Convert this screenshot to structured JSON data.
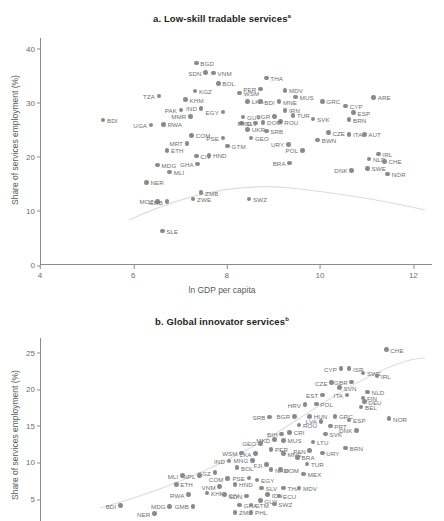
{
  "figure": {
    "axis_color": "#8c8c8c",
    "dot_color": "#8a8a8a",
    "label_color": "#6e6e6e",
    "title_color": "#231f20"
  },
  "panel_a": {
    "title": "a. Low-skill tradable services",
    "title_note": "a",
    "xlabel": "ln GDP per capita",
    "ylabel": "Share of services employment (%)"
  },
  "panel_b": {
    "title": "b. Global innovator services",
    "title_note": "b",
    "xlabel": "ln GDP per capita",
    "ylabel": "Share of services employment (%)"
  },
  "chart_data": [
    {
      "type": "scatter",
      "panel": "a",
      "title": "a. Low-skill tradable services",
      "xlabel": "ln GDP per capita",
      "ylabel": "Share of services employment (%)",
      "xlim": [
        4,
        12.4
      ],
      "ylim": [
        0,
        42
      ],
      "xticks": [
        4,
        6,
        8,
        10,
        12
      ],
      "yticks": [
        0,
        10,
        20,
        30,
        40
      ],
      "grid": false,
      "legend": "none",
      "has_fitted_curve": true,
      "fitted_curve_note": "light gray quadratic/lowess fit, rising from ~19% at x=5.9 to peak ~23.5% near x=8.5 then declining to ~20% at x=11.8",
      "points": [
        {
          "label": "BDI",
          "x": 5.35,
          "y": 26.8,
          "lpos": "r"
        },
        {
          "label": "BGD",
          "x": 7.35,
          "y": 37.4,
          "lpos": "r"
        },
        {
          "label": "SDN",
          "x": 7.55,
          "y": 35.6,
          "lpos": "l"
        },
        {
          "label": "VNM",
          "x": 7.72,
          "y": 35.5,
          "lpos": "r"
        },
        {
          "label": "WSM",
          "x": 8.28,
          "y": 31.8,
          "lpos": "r"
        },
        {
          "label": "THA",
          "x": 8.85,
          "y": 34.6,
          "lpos": "r"
        },
        {
          "label": "BOL",
          "x": 7.82,
          "y": 33.6,
          "lpos": "r"
        },
        {
          "label": "KGZ",
          "x": 7.32,
          "y": 32.2,
          "lpos": "r"
        },
        {
          "label": "TZA",
          "x": 6.55,
          "y": 31.3,
          "lpos": "l"
        },
        {
          "label": "PER",
          "x": 8.72,
          "y": 32.6,
          "lpos": "l"
        },
        {
          "label": "MDV",
          "x": 9.25,
          "y": 32.3,
          "lpos": "r"
        },
        {
          "label": "MUS",
          "x": 9.48,
          "y": 31.1,
          "lpos": "r"
        },
        {
          "label": "KHM",
          "x": 7.12,
          "y": 30.6,
          "lpos": "r"
        },
        {
          "label": "PAK",
          "x": 7.02,
          "y": 28.7,
          "lpos": "l"
        },
        {
          "label": "IND",
          "x": 7.45,
          "y": 29.0,
          "lpos": "l"
        },
        {
          "label": "EGY",
          "x": 7.92,
          "y": 28.3,
          "lpos": "l"
        },
        {
          "label": "LKA",
          "x": 8.45,
          "y": 30.3,
          "lpos": "r"
        },
        {
          "label": "BDI2",
          "x": 8.72,
          "y": 30.2,
          "lpos": "r"
        },
        {
          "label": "MNE",
          "x": 9.12,
          "y": 30.2,
          "lpos": "r"
        },
        {
          "label": "ARE",
          "x": 11.15,
          "y": 31.0,
          "lpos": "r"
        },
        {
          "label": "GRC",
          "x": 10.05,
          "y": 30.3,
          "lpos": "r"
        },
        {
          "label": "CYP",
          "x": 10.55,
          "y": 29.4,
          "lpos": "r"
        },
        {
          "label": "ESP",
          "x": 10.72,
          "y": 28.2,
          "lpos": "r"
        },
        {
          "label": "IRN",
          "x": 9.25,
          "y": 28.6,
          "lpos": "r"
        },
        {
          "label": "MMR",
          "x": 7.22,
          "y": 27.5,
          "lpos": "l"
        },
        {
          "label": "RWA",
          "x": 6.65,
          "y": 26.0,
          "lpos": "r"
        },
        {
          "label": "UGA",
          "x": 6.38,
          "y": 25.9,
          "lpos": "l"
        },
        {
          "label": "GUY",
          "x": 8.35,
          "y": 27.4,
          "lpos": "r"
        },
        {
          "label": "SLV",
          "x": 8.32,
          "y": 26.3,
          "lpos": "r"
        },
        {
          "label": "BGR",
          "x": 9.02,
          "y": 27.5,
          "lpos": "l"
        },
        {
          "label": "TUR",
          "x": 9.42,
          "y": 27.7,
          "lpos": "r"
        },
        {
          "label": "SVK",
          "x": 9.85,
          "y": 27.0,
          "lpos": "r"
        },
        {
          "label": "BRN",
          "x": 10.62,
          "y": 26.9,
          "lpos": "r"
        },
        {
          "label": "ROU",
          "x": 9.15,
          "y": 26.5,
          "lpos": "r"
        },
        {
          "label": "DOM",
          "x": 8.78,
          "y": 26.4,
          "lpos": "r"
        },
        {
          "label": "MKD",
          "x": 8.62,
          "y": 26.3,
          "lpos": "l"
        },
        {
          "label": "COM",
          "x": 7.25,
          "y": 24.0,
          "lpos": "r"
        },
        {
          "label": "UKR",
          "x": 8.45,
          "y": 25.1,
          "lpos": "r"
        },
        {
          "label": "SRB",
          "x": 8.85,
          "y": 24.8,
          "lpos": "r"
        },
        {
          "label": "CZE",
          "x": 10.18,
          "y": 24.5,
          "lpos": "r"
        },
        {
          "label": "ITA",
          "x": 10.62,
          "y": 24.2,
          "lpos": "r"
        },
        {
          "label": "AUT",
          "x": 10.95,
          "y": 24.2,
          "lpos": "r"
        },
        {
          "label": "PSE",
          "x": 7.92,
          "y": 23.5,
          "lpos": "l"
        },
        {
          "label": "GEO",
          "x": 8.52,
          "y": 23.5,
          "lpos": "r"
        },
        {
          "label": "BWN",
          "x": 9.95,
          "y": 23.1,
          "lpos": "r"
        },
        {
          "label": "MRT",
          "x": 7.15,
          "y": 22.5,
          "lpos": "l"
        },
        {
          "label": "GTM",
          "x": 8.02,
          "y": 22.0,
          "lpos": "r"
        },
        {
          "label": "URY",
          "x": 9.32,
          "y": 22.3,
          "lpos": "l"
        },
        {
          "label": "POL",
          "x": 9.62,
          "y": 21.2,
          "lpos": "l"
        },
        {
          "label": "ETH",
          "x": 6.72,
          "y": 21.2,
          "lpos": "r"
        },
        {
          "label": "CIV",
          "x": 7.35,
          "y": 20.2,
          "lpos": "r"
        },
        {
          "label": "HND",
          "x": 7.62,
          "y": 20.3,
          "lpos": "r"
        },
        {
          "label": "IRL",
          "x": 11.25,
          "y": 20.5,
          "lpos": "r"
        },
        {
          "label": "NLD",
          "x": 11.05,
          "y": 19.6,
          "lpos": "r"
        },
        {
          "label": "CHE",
          "x": 11.38,
          "y": 19.2,
          "lpos": "r"
        },
        {
          "label": "GHA",
          "x": 7.38,
          "y": 18.7,
          "lpos": "l"
        },
        {
          "label": "MDG",
          "x": 6.52,
          "y": 18.5,
          "lpos": "r"
        },
        {
          "label": "BRA",
          "x": 9.35,
          "y": 18.9,
          "lpos": "l"
        },
        {
          "label": "SWE",
          "x": 11.02,
          "y": 17.9,
          "lpos": "r"
        },
        {
          "label": "DNK",
          "x": 10.68,
          "y": 17.5,
          "lpos": "l"
        },
        {
          "label": "MLI",
          "x": 6.78,
          "y": 17.2,
          "lpos": "r"
        },
        {
          "label": "NOR",
          "x": 11.45,
          "y": 16.8,
          "lpos": "r"
        },
        {
          "label": "NER",
          "x": 6.28,
          "y": 15.3,
          "lpos": "r"
        },
        {
          "label": "ZMB",
          "x": 7.45,
          "y": 13.4,
          "lpos": "r"
        },
        {
          "label": "ZWE",
          "x": 7.28,
          "y": 12.2,
          "lpos": "r"
        },
        {
          "label": "MOZ",
          "x": 6.52,
          "y": 11.8,
          "lpos": "l"
        },
        {
          "label": "GMB",
          "x": 6.72,
          "y": 11.7,
          "lpos": "l"
        },
        {
          "label": "SWZ",
          "x": 8.48,
          "y": 12.2,
          "lpos": "r"
        },
        {
          "label": "SLE",
          "x": 6.62,
          "y": 6.3,
          "lpos": "r"
        }
      ]
    },
    {
      "type": "scatter",
      "panel": "b",
      "title": "b. Global innovator services",
      "xlabel": "ln GDP per capita",
      "ylabel": "Share of services employment (%)",
      "xlim": [
        4,
        12.4
      ],
      "ylim": [
        2,
        27
      ],
      "xticks": [
        4,
        6,
        8,
        10,
        12
      ],
      "yticks": [
        5,
        10,
        15,
        20,
        25
      ],
      "grid": false,
      "legend": "none",
      "has_fitted_curve": true,
      "fitted_curve_note": "light gray upward-sloping fit from ~3.5% at low GDP to ~19% at high GDP",
      "points": [
        {
          "label": "CHE",
          "x": 11.42,
          "y": 25.4,
          "lpos": "r"
        },
        {
          "label": "CYP",
          "x": 10.45,
          "y": 22.8,
          "lpos": "l"
        },
        {
          "label": "ISR",
          "x": 10.62,
          "y": 22.8,
          "lpos": "r"
        },
        {
          "label": "SWE",
          "x": 10.92,
          "y": 22.2,
          "lpos": "r"
        },
        {
          "label": "IRL",
          "x": 11.22,
          "y": 21.8,
          "lpos": "r"
        },
        {
          "label": "GBR",
          "x": 10.68,
          "y": 21.0,
          "lpos": "l"
        },
        {
          "label": "CZE",
          "x": 10.25,
          "y": 20.9,
          "lpos": "l"
        },
        {
          "label": "SVN",
          "x": 10.42,
          "y": 20.2,
          "lpos": "r"
        },
        {
          "label": "NLD",
          "x": 11.02,
          "y": 19.6,
          "lpos": "r"
        },
        {
          "label": "EST",
          "x": 10.05,
          "y": 19.2,
          "lpos": "l"
        },
        {
          "label": "ITA",
          "x": 10.58,
          "y": 19.2,
          "lpos": "l"
        },
        {
          "label": "FIN",
          "x": 10.92,
          "y": 18.8,
          "lpos": "r"
        },
        {
          "label": "DEU",
          "x": 10.95,
          "y": 18.3,
          "lpos": "r"
        },
        {
          "label": "BEL",
          "x": 10.88,
          "y": 17.6,
          "lpos": "r"
        },
        {
          "label": "POL",
          "x": 9.92,
          "y": 18.0,
          "lpos": "r"
        },
        {
          "label": "HRV",
          "x": 9.68,
          "y": 17.9,
          "lpos": "l"
        },
        {
          "label": "GRC",
          "x": 10.32,
          "y": 16.3,
          "lpos": "r"
        },
        {
          "label": "HUN",
          "x": 9.78,
          "y": 16.3,
          "lpos": "r"
        },
        {
          "label": "BGR",
          "x": 9.45,
          "y": 16.3,
          "lpos": "l"
        },
        {
          "label": "SRB",
          "x": 8.92,
          "y": 16.2,
          "lpos": "l"
        },
        {
          "label": "NOR",
          "x": 11.48,
          "y": 16.0,
          "lpos": "r"
        },
        {
          "label": "ESP",
          "x": 10.62,
          "y": 15.8,
          "lpos": "r"
        },
        {
          "label": "LVA",
          "x": 10.02,
          "y": 15.6,
          "lpos": "l"
        },
        {
          "label": "ROU",
          "x": 9.55,
          "y": 15.1,
          "lpos": "r"
        },
        {
          "label": "PRT",
          "x": 10.22,
          "y": 15.0,
          "lpos": "r"
        },
        {
          "label": "DNK",
          "x": 10.78,
          "y": 14.4,
          "lpos": "l"
        },
        {
          "label": "CRI",
          "x": 9.35,
          "y": 14.1,
          "lpos": "r"
        },
        {
          "label": "BIH",
          "x": 9.18,
          "y": 13.9,
          "lpos": "l"
        },
        {
          "label": "SVK",
          "x": 10.12,
          "y": 13.9,
          "lpos": "r"
        },
        {
          "label": "MUS",
          "x": 9.22,
          "y": 13.0,
          "lpos": "r"
        },
        {
          "label": "MKD",
          "x": 9.02,
          "y": 13.1,
          "lpos": "l"
        },
        {
          "label": "LTU",
          "x": 9.85,
          "y": 12.8,
          "lpos": "r"
        },
        {
          "label": "GEO",
          "x": 8.72,
          "y": 12.6,
          "lpos": "l"
        },
        {
          "label": "BRN",
          "x": 10.55,
          "y": 12.0,
          "lpos": "r"
        },
        {
          "label": "PER",
          "x": 8.95,
          "y": 11.8,
          "lpos": "r"
        },
        {
          "label": "PAN",
          "x": 9.78,
          "y": 11.6,
          "lpos": "l"
        },
        {
          "label": "MNE",
          "x": 9.22,
          "y": 11.2,
          "lpos": "r"
        },
        {
          "label": "URY",
          "x": 10.05,
          "y": 11.3,
          "lpos": "r"
        },
        {
          "label": "LKA",
          "x": 8.62,
          "y": 11.2,
          "lpos": "l"
        },
        {
          "label": "WSM",
          "x": 8.32,
          "y": 11.3,
          "lpos": "l"
        },
        {
          "label": "IND",
          "x": 8.05,
          "y": 10.2,
          "lpos": "l"
        },
        {
          "label": "BRA",
          "x": 9.52,
          "y": 10.7,
          "lpos": "r"
        },
        {
          "label": "MNG",
          "x": 8.55,
          "y": 10.3,
          "lpos": "l"
        },
        {
          "label": "TUR",
          "x": 9.72,
          "y": 9.8,
          "lpos": "r"
        },
        {
          "label": "FJI",
          "x": 8.85,
          "y": 9.7,
          "lpos": "l"
        },
        {
          "label": "BOL",
          "x": 8.22,
          "y": 9.3,
          "lpos": "r"
        },
        {
          "label": "NAM",
          "x": 8.95,
          "y": 9.0,
          "lpos": "r"
        },
        {
          "label": "DOM",
          "x": 9.15,
          "y": 9.0,
          "lpos": "r"
        },
        {
          "label": "KGZ",
          "x": 7.75,
          "y": 8.6,
          "lpos": "l"
        },
        {
          "label": "NPL",
          "x": 7.42,
          "y": 8.2,
          "lpos": "l"
        },
        {
          "label": "MLI",
          "x": 7.05,
          "y": 8.2,
          "lpos": "l"
        },
        {
          "label": "MEX",
          "x": 9.65,
          "y": 8.4,
          "lpos": "r"
        },
        {
          "label": "PSE",
          "x": 8.48,
          "y": 7.9,
          "lpos": "l"
        },
        {
          "label": "COM",
          "x": 8.02,
          "y": 7.8,
          "lpos": "l"
        },
        {
          "label": "EGY",
          "x": 8.65,
          "y": 7.6,
          "lpos": "r"
        },
        {
          "label": "ETH",
          "x": 6.92,
          "y": 7.0,
          "lpos": "r"
        },
        {
          "label": "HND",
          "x": 8.18,
          "y": 7.0,
          "lpos": "r"
        },
        {
          "label": "VNM",
          "x": 7.85,
          "y": 6.7,
          "lpos": "l"
        },
        {
          "label": "SLV",
          "x": 8.75,
          "y": 6.5,
          "lpos": "r"
        },
        {
          "label": "THA",
          "x": 9.22,
          "y": 6.5,
          "lpos": "r"
        },
        {
          "label": "MDV",
          "x": 9.55,
          "y": 6.5,
          "lpos": "r"
        },
        {
          "label": "KHM",
          "x": 7.58,
          "y": 5.8,
          "lpos": "r"
        },
        {
          "label": "RWA",
          "x": 7.18,
          "y": 5.6,
          "lpos": "l"
        },
        {
          "label": "CIV",
          "x": 7.95,
          "y": 5.6,
          "lpos": "r"
        },
        {
          "label": "IDN",
          "x": 8.88,
          "y": 5.6,
          "lpos": "r"
        },
        {
          "label": "ECU",
          "x": 9.12,
          "y": 5.4,
          "lpos": "r"
        },
        {
          "label": "SDN",
          "x": 8.42,
          "y": 5.4,
          "lpos": "l"
        },
        {
          "label": "GUY",
          "x": 8.72,
          "y": 4.8,
          "lpos": "r"
        },
        {
          "label": "BDI",
          "x": 5.72,
          "y": 4.1,
          "lpos": "l"
        },
        {
          "label": "MDG",
          "x": 6.78,
          "y": 4.0,
          "lpos": "l"
        },
        {
          "label": "GMB",
          "x": 7.28,
          "y": 4.0,
          "lpos": "l"
        },
        {
          "label": "GHA",
          "x": 8.28,
          "y": 4.2,
          "lpos": "r"
        },
        {
          "label": "GTM",
          "x": 8.52,
          "y": 4.2,
          "lpos": "r"
        },
        {
          "label": "SWZ",
          "x": 9.02,
          "y": 4.3,
          "lpos": "r"
        },
        {
          "label": "ZMB",
          "x": 8.18,
          "y": 3.2,
          "lpos": "r"
        },
        {
          "label": "PHL",
          "x": 8.52,
          "y": 3.2,
          "lpos": "r"
        },
        {
          "label": "NER",
          "x": 6.45,
          "y": 3.0,
          "lpos": "l"
        }
      ]
    }
  ]
}
